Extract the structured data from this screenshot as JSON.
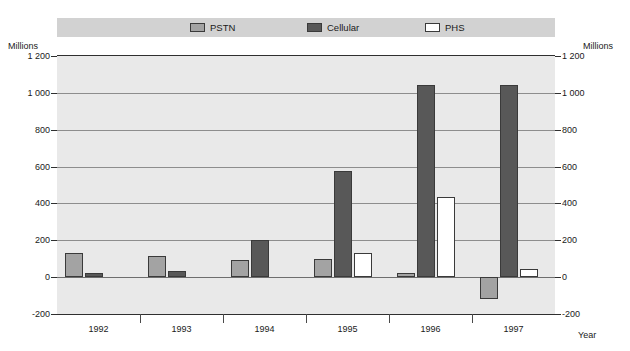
{
  "title": "",
  "legend": {
    "position": "top",
    "items": [
      {
        "label": "PSTN",
        "color": "#a3a3a3",
        "icon": "legend-swatch-pstn"
      },
      {
        "label": "Cellular",
        "color": "#585858",
        "icon": "legend-swatch-cellular"
      },
      {
        "label": "PHS",
        "color": "#ffffff",
        "icon": "legend-swatch-phs"
      }
    ]
  },
  "axes": {
    "y_unit_left": "Millions",
    "y_unit_right": "Millions",
    "x_label": "Year",
    "y_ticks": [
      "1 200",
      "1 000",
      "800",
      "600",
      "400",
      "200",
      "0",
      "-200"
    ],
    "y_tick_values": [
      1200,
      1000,
      800,
      600,
      400,
      200,
      0,
      -200
    ]
  },
  "chart_data": {
    "type": "bar",
    "title": "",
    "xlabel": "Year",
    "ylabel": "Millions",
    "ylim": [
      -200,
      1200
    ],
    "ytick_step": 200,
    "grid": true,
    "legend_position": "top",
    "categories": [
      "1992",
      "1993",
      "1994",
      "1995",
      "1996",
      "1997"
    ],
    "series": [
      {
        "name": "PSTN",
        "color": "#a3a3a3",
        "values": [
          130,
          115,
          95,
          100,
          25,
          -120
        ]
      },
      {
        "name": "Cellular",
        "color": "#585858",
        "values": [
          20,
          35,
          200,
          575,
          1045,
          1045
        ]
      },
      {
        "name": "PHS",
        "color": "#ffffff",
        "values": [
          null,
          null,
          null,
          130,
          435,
          45
        ]
      }
    ]
  }
}
